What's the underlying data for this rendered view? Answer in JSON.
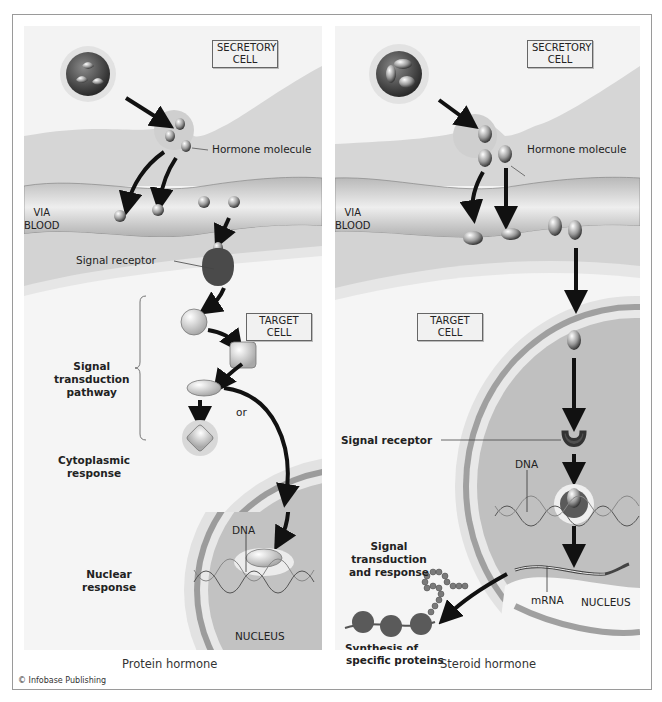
{
  "figure": {
    "copyright": "© Infobase Publishing",
    "colors": {
      "background": "#ffffff",
      "frame_border": "#9a9a9a",
      "cell_light": "#f2f2f2",
      "cell_mid": "#d8d8d8",
      "blood_vessel": "#c8c8c8",
      "nucleus": "#bdbdbd",
      "arrow": "#111111"
    }
  },
  "left_panel": {
    "caption": "Protein hormone",
    "secretory_cell_label_line1": "SECRETORY",
    "secretory_cell_label_line2": "CELL",
    "hormone_molecule_label": "Hormone molecule",
    "via_blood_line1": "VIA",
    "via_blood_line2": "BLOOD",
    "signal_receptor_label": "Signal receptor",
    "target_cell_label_line1": "TARGET",
    "target_cell_label_line2": "CELL",
    "signal_transduction_line1": "Signal",
    "signal_transduction_line2": "transduction",
    "signal_transduction_line3": "pathway",
    "or_label": "or",
    "cytoplasmic_line1": "Cytoplasmic",
    "cytoplasmic_line2": "response",
    "dna_label": "DNA",
    "nuclear_line1": "Nuclear",
    "nuclear_line2": "response",
    "nucleus_label": "NUCLEUS"
  },
  "right_panel": {
    "caption": "Steroid hormone",
    "secretory_cell_label_line1": "SECRETORY",
    "secretory_cell_label_line2": "CELL",
    "hormone_molecule_label": "Hormone molecule",
    "via_blood_line1": "VIA",
    "via_blood_line2": "BLOOD",
    "target_cell_label_line1": "TARGET",
    "target_cell_label_line2": "CELL",
    "signal_receptor_label": "Signal receptor",
    "dna_label": "DNA",
    "signal_transduction_line1": "Signal",
    "signal_transduction_line2": "transduction",
    "signal_transduction_line3": "and response",
    "mrna_label": "mRNA",
    "nucleus_label": "NUCLEUS",
    "synthesis_line1": "Synthesis of",
    "synthesis_line2": "specific proteins"
  }
}
